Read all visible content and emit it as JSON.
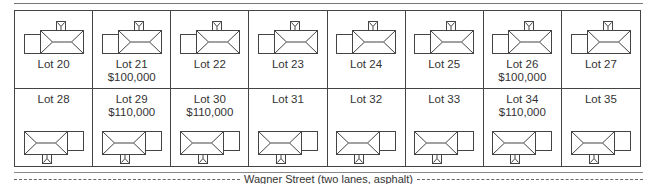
{
  "diagram": {
    "type": "subdivision-lot-plan",
    "street": {
      "label": "Wagner Street (two lanes, asphalt)"
    },
    "rows": [
      {
        "position": "north-side",
        "house_orientation": "porch-north",
        "lots": [
          {
            "label": "Lot 20",
            "price": ""
          },
          {
            "label": "Lot 21",
            "price": "$100,000"
          },
          {
            "label": "Lot 22",
            "price": ""
          },
          {
            "label": "Lot 23",
            "price": ""
          },
          {
            "label": "Lot 24",
            "price": ""
          },
          {
            "label": "Lot 25",
            "price": ""
          },
          {
            "label": "Lot 26",
            "price": "$100,000"
          },
          {
            "label": "Lot 27",
            "price": ""
          }
        ]
      },
      {
        "position": "south-side",
        "house_orientation": "porch-south",
        "lots": [
          {
            "label": "Lot 28",
            "price": ""
          },
          {
            "label": "Lot 29",
            "price": "$110,000"
          },
          {
            "label": "Lot 30",
            "price": "$110,000"
          },
          {
            "label": "Lot 31",
            "price": ""
          },
          {
            "label": "Lot 32",
            "price": ""
          },
          {
            "label": "Lot 33",
            "price": ""
          },
          {
            "label": "Lot 34",
            "price": "$110,000"
          },
          {
            "label": "Lot 35",
            "price": ""
          }
        ]
      }
    ],
    "icons": {
      "house": "house-plan-icon"
    },
    "colors": {
      "line": "#444444",
      "text": "#333333",
      "background": "#ffffff"
    }
  }
}
